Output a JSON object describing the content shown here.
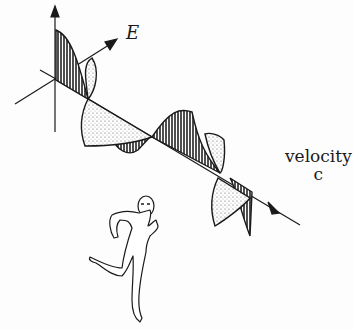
{
  "diagram": {
    "labels": {
      "field": "E",
      "velocity_word": "velocity",
      "velocity_symbol": "c"
    },
    "figure": "running-man",
    "colors": {
      "line": "#1a1a1a",
      "dark_fill": "#3a3a3a",
      "stipple_fill": "#e8e8e8",
      "background": "#fdfdfd"
    }
  }
}
